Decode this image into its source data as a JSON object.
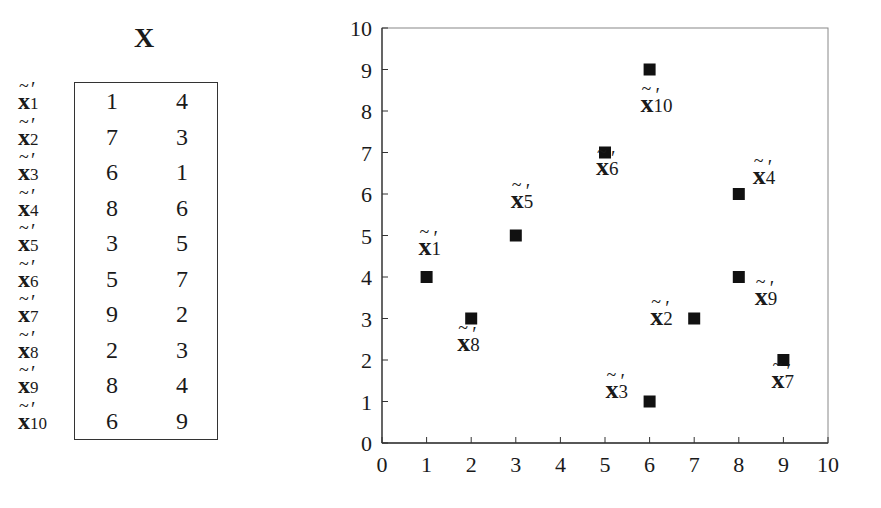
{
  "table": {
    "title": "X",
    "rows": [
      {
        "label": "x",
        "sub": "1",
        "values": [
          "1",
          "4"
        ]
      },
      {
        "label": "x",
        "sub": "2",
        "values": [
          "7",
          "3"
        ]
      },
      {
        "label": "x",
        "sub": "3",
        "values": [
          "6",
          "1"
        ]
      },
      {
        "label": "x",
        "sub": "4",
        "values": [
          "8",
          "6"
        ]
      },
      {
        "label": "x",
        "sub": "5",
        "values": [
          "3",
          "5"
        ]
      },
      {
        "label": "x",
        "sub": "6",
        "values": [
          "5",
          "7"
        ]
      },
      {
        "label": "x",
        "sub": "7",
        "values": [
          "9",
          "2"
        ]
      },
      {
        "label": "x",
        "sub": "8",
        "values": [
          "2",
          "3"
        ]
      },
      {
        "label": "x",
        "sub": "9",
        "values": [
          "8",
          "4"
        ]
      },
      {
        "label": "x",
        "sub": "10",
        "values": [
          "6",
          "9"
        ]
      }
    ]
  },
  "chart_data": {
    "type": "scatter",
    "title": "",
    "xlabel": "",
    "ylabel": "",
    "xlim": [
      0,
      10
    ],
    "ylim": [
      0,
      10
    ],
    "xticks": [
      "0",
      "1",
      "2",
      "3",
      "4",
      "5",
      "6",
      "7",
      "8",
      "9",
      "10"
    ],
    "yticks": [
      "0",
      "1",
      "2",
      "3",
      "4",
      "5",
      "6",
      "7",
      "8",
      "9",
      "10"
    ],
    "grid": false,
    "marker": "square",
    "marker_color": "#111111",
    "points": [
      {
        "label": "x'1",
        "x": 1,
        "y": 4
      },
      {
        "label": "x'2",
        "x": 7,
        "y": 3
      },
      {
        "label": "x'3",
        "x": 6,
        "y": 1
      },
      {
        "label": "x'4",
        "x": 8,
        "y": 6
      },
      {
        "label": "x'5",
        "x": 3,
        "y": 5
      },
      {
        "label": "x'6",
        "x": 5,
        "y": 7
      },
      {
        "label": "x'7",
        "x": 9,
        "y": 2
      },
      {
        "label": "x'8",
        "x": 2,
        "y": 3
      },
      {
        "label": "x'9",
        "x": 8,
        "y": 4
      },
      {
        "label": "x'10",
        "x": 6,
        "y": 9
      }
    ]
  }
}
